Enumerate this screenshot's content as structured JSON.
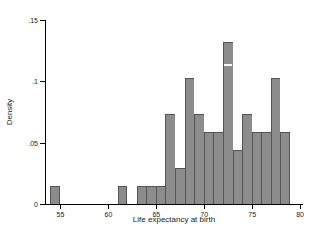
{
  "chart_data": {
    "type": "bar",
    "subtype": "histogram",
    "title": "",
    "xlabel": "Life expectancy at birth",
    "ylabel": "Density",
    "xlim": [
      53.4,
      80.4
    ],
    "ylim": [
      0,
      0.15
    ],
    "x_ticks": [
      55,
      60,
      65,
      70,
      75,
      80
    ],
    "x_tick_labels": [
      "55",
      "60",
      "65",
      "70",
      "75",
      "80"
    ],
    "y_ticks": [
      0,
      0.05,
      0.1,
      0.15
    ],
    "y_tick_labels": [
      "0",
      ".05",
      ".1",
      ".15"
    ],
    "bin_width": 1,
    "total_observations": 68,
    "bins": [
      {
        "x0": 54,
        "x1": 55,
        "count": 1,
        "density": 0.0147
      },
      {
        "x0": 61,
        "x1": 62,
        "count": 1,
        "density": 0.0147
      },
      {
        "x0": 63,
        "x1": 64,
        "count": 1,
        "density": 0.0147
      },
      {
        "x0": 64,
        "x1": 65,
        "count": 1,
        "density": 0.0147
      },
      {
        "x0": 65,
        "x1": 66,
        "count": 1,
        "density": 0.0147
      },
      {
        "x0": 66,
        "x1": 67,
        "count": 5,
        "density": 0.0735
      },
      {
        "x0": 67,
        "x1": 68,
        "count": 2,
        "density": 0.0294
      },
      {
        "x0": 68,
        "x1": 69,
        "count": 7,
        "density": 0.1029
      },
      {
        "x0": 69,
        "x1": 70,
        "count": 5,
        "density": 0.0735
      },
      {
        "x0": 70,
        "x1": 71,
        "count": 4,
        "density": 0.0588
      },
      {
        "x0": 71,
        "x1": 72,
        "count": 4,
        "density": 0.0588
      },
      {
        "x0": 72,
        "x1": 73,
        "count": 9,
        "density": 0.1324
      },
      {
        "x0": 73,
        "x1": 74,
        "count": 3,
        "density": 0.0441
      },
      {
        "x0": 74,
        "x1": 75,
        "count": 5,
        "density": 0.0735
      },
      {
        "x0": 75,
        "x1": 76,
        "count": 4,
        "density": 0.0588
      },
      {
        "x0": 76,
        "x1": 77,
        "count": 4,
        "density": 0.0588
      },
      {
        "x0": 77,
        "x1": 78,
        "count": 7,
        "density": 0.1029
      },
      {
        "x0": 78,
        "x1": 79,
        "count": 4,
        "density": 0.0588
      }
    ],
    "artifact_line": {
      "over_bin_x0": 72,
      "at_density": 0.1145
    },
    "legend": null,
    "grid": false,
    "colors": {
      "bar_fill": "#8c8c8c",
      "bar_outline": "#545454",
      "axis": "#000000",
      "background": "#ffffff",
      "artifact": "#f6f6f6"
    }
  }
}
